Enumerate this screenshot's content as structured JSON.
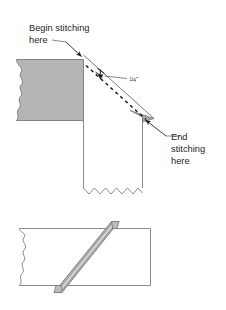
{
  "figure": {
    "colors": {
      "fabric_gray": "#b5b5b5",
      "seam_gray": "#b0b0b0",
      "seam_highlight": "#d8d8d8",
      "outline": "#6d6d6d",
      "dark_outline": "#4a4a4a",
      "text": "#231f20",
      "background": "#ffffff"
    },
    "top_diagram": {
      "begin_label": {
        "line1": "Begin stitching",
        "line2": "here"
      },
      "measurement_label": {
        "numerator": "1",
        "denominator": "4",
        "unit": "\"",
        "full": "1/4\""
      },
      "end_label": {
        "line1": "End",
        "line2": "stitching",
        "line3": "here"
      }
    },
    "bottom_diagram": {
      "caption": ""
    }
  }
}
